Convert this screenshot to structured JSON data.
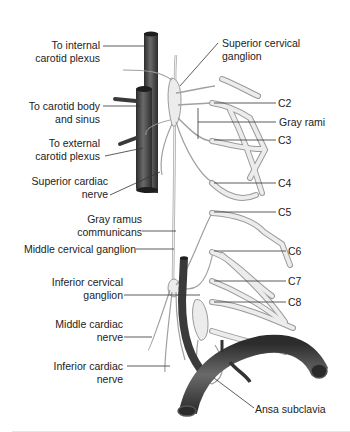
{
  "figure": {
    "labels_left": [
      {
        "id": "to-internal-carotid-plexus",
        "line1": "To internal",
        "line2": "carotid plexus"
      },
      {
        "id": "to-carotid-body-and-sinus",
        "line1": "To carotid body",
        "line2": "and sinus"
      },
      {
        "id": "to-external-carotid-plexus",
        "line1": "To external",
        "line2": "carotid plexus"
      },
      {
        "id": "superior-cardiac-nerve",
        "line1": "Superior cardiac",
        "line2": "nerve"
      },
      {
        "id": "gray-ramus-communicans",
        "line1": "Gray ramus",
        "line2": "communicans"
      },
      {
        "id": "middle-cervical-ganglion",
        "line1": "Middle cervical ganglion"
      },
      {
        "id": "inferior-cervical-ganglion",
        "line1": "Inferior cervical",
        "line2": "ganglion"
      },
      {
        "id": "middle-cardiac-nerve",
        "line1": "Middle cardiac",
        "line2": "nerve"
      },
      {
        "id": "inferior-cardiac-nerve",
        "line1": "Inferior cardiac",
        "line2": "nerve"
      }
    ],
    "labels_right": [
      {
        "id": "superior-cervical-ganglion",
        "line1": "Superior cervical",
        "line2": "ganglion"
      },
      {
        "id": "c2",
        "line1": "C2"
      },
      {
        "id": "gray-rami",
        "line1": "Gray rami"
      },
      {
        "id": "c3",
        "line1": "C3"
      },
      {
        "id": "c4",
        "line1": "C4"
      },
      {
        "id": "c5",
        "line1": "C5"
      },
      {
        "id": "c6",
        "line1": "C6"
      },
      {
        "id": "c7",
        "line1": "C7"
      },
      {
        "id": "c8",
        "line1": "C8"
      },
      {
        "id": "ansa-subclavia",
        "line1": "Ansa subclavia"
      }
    ],
    "colors": {
      "vessel": "#4a4a4a",
      "vessel_dark": "#2e2e2e",
      "nerve_fill": "#e8e8e8",
      "nerve_stroke": "#9a9a9a",
      "leader_line": "#333333",
      "text": "#222222"
    }
  }
}
